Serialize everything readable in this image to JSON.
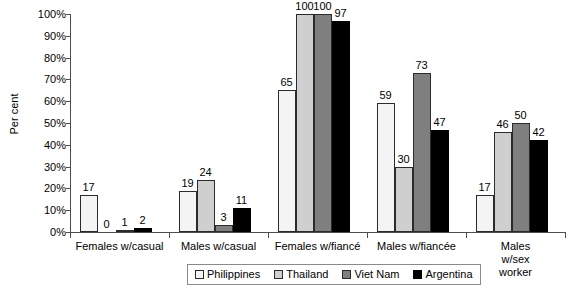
{
  "chart_data": {
    "type": "bar",
    "title": "",
    "subtitle": "",
    "xlabel": "",
    "ylabel": "Per cent",
    "ylim": [
      0,
      100
    ],
    "ytick_step": 10,
    "ytick_labels": [
      "0%",
      "10%",
      "20%",
      "30%",
      "40%",
      "50%",
      "60%",
      "70%",
      "80%",
      "90%",
      "100%"
    ],
    "grid": false,
    "legend_position": "bottom",
    "value_labels": true,
    "categories": [
      "Females w/casual",
      "Males w/casual",
      "Females  w/fiancé",
      "Males  w/fiancée",
      "Males w/sex\nworker"
    ],
    "series": [
      {
        "name": "Philippines",
        "color": "#f4f4f4",
        "values": [
          17,
          19,
          65,
          59,
          17
        ]
      },
      {
        "name": "Thailand",
        "color": "#cfcfcf",
        "values": [
          0,
          24,
          100,
          30,
          46
        ]
      },
      {
        "name": "Viet Nam",
        "color": "#7f7f7f",
        "values": [
          1,
          3,
          100,
          73,
          50
        ]
      },
      {
        "name": "Argentina",
        "color": "#000000",
        "values": [
          2,
          11,
          97,
          47,
          42
        ]
      }
    ]
  },
  "legend": {
    "items": [
      {
        "label": "Philippines"
      },
      {
        "label": "Thailand"
      },
      {
        "label": "Viet Nam"
      },
      {
        "label": "Argentina"
      }
    ]
  }
}
